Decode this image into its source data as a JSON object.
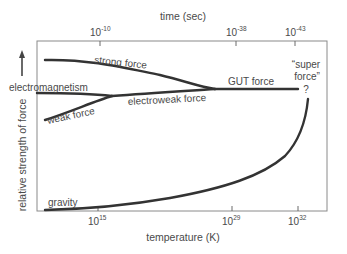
{
  "diagram": {
    "top_axis": {
      "title": "time (sec)",
      "ticks": [
        {
          "base": "10",
          "exp": "-10"
        },
        {
          "base": "10",
          "exp": "-38"
        },
        {
          "base": "10",
          "exp": "-43"
        }
      ]
    },
    "bottom_axis": {
      "title": "temperature (K)",
      "ticks": [
        {
          "base": "10",
          "exp": "15"
        },
        {
          "base": "10",
          "exp": "29"
        },
        {
          "base": "10",
          "exp": "32"
        }
      ]
    },
    "y_axis": {
      "title": "relative strength of force",
      "arrow": "up-arrow-icon"
    },
    "curves": {
      "strong": "strong force",
      "electromagnetism": "electromagnetism",
      "weak": "weak force",
      "electroweak": "electroweak force",
      "gut": "GUT force",
      "super_line1": "“super",
      "super_line2": "force”",
      "super_question": "?",
      "gravity": "gravity"
    },
    "colors": {
      "curve": "#333333",
      "frame": "#8a8a8a",
      "text": "#4a4a4a"
    }
  }
}
